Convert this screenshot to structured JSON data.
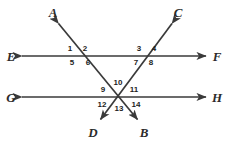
{
  "figure": {
    "background_color": "#ffffff",
    "line_color": "#3a3a3a",
    "label_color": "#2b2b2b",
    "angle_label_color": "#1d1d1d",
    "width": 228,
    "height": 145
  },
  "lines": [
    {
      "name": "line-ef",
      "label_start": "E",
      "label_end": "F",
      "description": "horizontal line with arrowheads both ends (upper)"
    },
    {
      "name": "line-gh",
      "label_start": "G",
      "label_end": "H",
      "description": "horizontal line with arrowheads both ends (lower)"
    },
    {
      "name": "line-ab",
      "label_start": "A",
      "label_end": "B",
      "description": "transversal from upper-left to lower-right"
    },
    {
      "name": "line-cd",
      "label_start": "C",
      "label_end": "D",
      "description": "transversal from upper-right to lower-left"
    }
  ],
  "point_labels": [
    {
      "id": "A",
      "text": "A",
      "x": 53,
      "y": 12
    },
    {
      "id": "C",
      "text": "C",
      "x": 178,
      "y": 12
    },
    {
      "id": "E",
      "text": "E",
      "x": 11,
      "y": 56
    },
    {
      "id": "F",
      "text": "F",
      "x": 217,
      "y": 56
    },
    {
      "id": "G",
      "text": "G",
      "x": 11,
      "y": 97
    },
    {
      "id": "H",
      "text": "H",
      "x": 217,
      "y": 97
    },
    {
      "id": "D",
      "text": "D",
      "x": 93,
      "y": 132
    },
    {
      "id": "B",
      "text": "B",
      "x": 144,
      "y": 132
    }
  ],
  "angle_labels": [
    {
      "id": "1",
      "text": "1",
      "x": 70,
      "y": 49
    },
    {
      "id": "2",
      "text": "2",
      "x": 85,
      "y": 49
    },
    {
      "id": "3",
      "text": "3",
      "x": 139,
      "y": 49
    },
    {
      "id": "4",
      "text": "4",
      "x": 154,
      "y": 49
    },
    {
      "id": "5",
      "text": "5",
      "x": 72,
      "y": 63
    },
    {
      "id": "6",
      "text": "6",
      "x": 88,
      "y": 63
    },
    {
      "id": "7",
      "text": "7",
      "x": 136,
      "y": 63
    },
    {
      "id": "8",
      "text": "8",
      "x": 151,
      "y": 63
    },
    {
      "id": "9",
      "text": "9",
      "x": 103,
      "y": 90
    },
    {
      "id": "10",
      "text": "10",
      "x": 118,
      "y": 83
    },
    {
      "id": "11",
      "text": "11",
      "x": 134,
      "y": 90
    },
    {
      "id": "12",
      "text": "12",
      "x": 102,
      "y": 105
    },
    {
      "id": "13",
      "text": "13",
      "x": 119,
      "y": 109
    },
    {
      "id": "14",
      "text": "14",
      "x": 136,
      "y": 105
    }
  ],
  "intersections": [
    {
      "name": "intersection-ef-ab",
      "x": 79,
      "y": 56
    },
    {
      "name": "intersection-ef-cd",
      "x": 146,
      "y": 56
    },
    {
      "name": "intersection-concurrent-gh",
      "x": 117,
      "y": 97
    }
  ]
}
